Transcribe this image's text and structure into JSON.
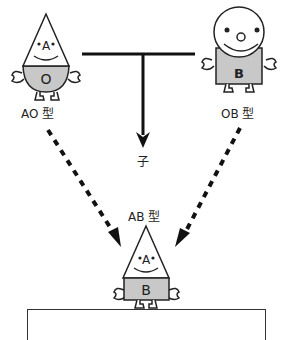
{
  "diagram": {
    "parents": [
      {
        "id": "ao",
        "label": "AO 型",
        "head_letter": "A",
        "body_letter": "O",
        "shape": "triangle"
      },
      {
        "id": "ob",
        "label": "OB 型",
        "body_letter": "B",
        "shape": "circle"
      }
    ],
    "child_label": "子",
    "offspring": {
      "label": "AB 型",
      "head_letter": "A",
      "body_letter": "B",
      "shape": "triangle"
    },
    "colors": {
      "line": "#111111",
      "body_fill": "#c8c8c8",
      "outline": "#222222"
    }
  }
}
